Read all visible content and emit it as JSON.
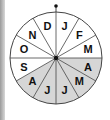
{
  "wheel": {
    "center": [
      56,
      58
    ],
    "radius": 46,
    "shade_color": "#d6d6d6",
    "line_color": "#444444",
    "segments": [
      {
        "label": "J",
        "shaded": false
      },
      {
        "label": "F",
        "shaded": false
      },
      {
        "label": "M",
        "shaded": false
      },
      {
        "label": "A",
        "shaded": true
      },
      {
        "label": "M",
        "shaded": true
      },
      {
        "label": "J",
        "shaded": true
      },
      {
        "label": "J",
        "shaded": true
      },
      {
        "label": "A",
        "shaded": true
      },
      {
        "label": "S",
        "shaded": false
      },
      {
        "label": "O",
        "shaded": false
      },
      {
        "label": "N",
        "shaded": false
      },
      {
        "label": "D",
        "shaded": false
      }
    ]
  }
}
